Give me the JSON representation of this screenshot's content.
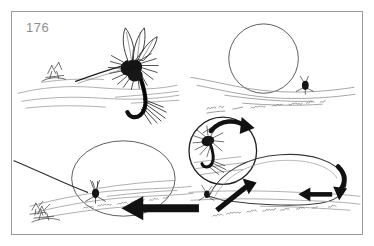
{
  "page": {
    "number_label": "176",
    "background_color": "#ffffff",
    "frame_border_color": "#9a9a9a",
    "ink_color": "#1a1a1a",
    "light_ink_color": "#8d8d8d",
    "page_number_color": "#8d8d8d"
  },
  "figure": {
    "title": "",
    "caption": "",
    "panel_count": 4,
    "panels": [
      {
        "id": "panel-top-left",
        "name": "dry-fly-close-up-panel",
        "description": "Large pen-and-ink drawing of a dry fly with upright divided wings, hackle and tail resting on the water surface",
        "elements": [
          "dry-fly-large",
          "waterline",
          "ripple-lines",
          "small-fly-left"
        ]
      },
      {
        "id": "panel-top-right",
        "name": "magnifier-circle-panel",
        "description": "Open circle outline above a waterline with a small dark fly sitting on the surface and squiggle ripple marks",
        "elements": [
          "magnifier-circle",
          "waterline",
          "small-fly",
          "ripple-squiggles"
        ]
      },
      {
        "id": "panel-bottom-left",
        "name": "magnifier-ellipse-panel",
        "description": "Large ellipse outline over a waterline with a small fly and leader line entering from the left",
        "elements": [
          "magnifier-ellipse",
          "waterline",
          "small-fly",
          "leader-line",
          "ripple-squiggles"
        ]
      },
      {
        "id": "panel-bottom-right",
        "name": "line-loop-arrows-panel",
        "description": "Circle inset showing a fly with a curved rotation arrow, plus a teardrop line loop on the water with bold directional arrows",
        "elements": [
          "inset-circle",
          "fly-in-inset",
          "curved-rotation-arrow",
          "line-loop",
          "arrow-left-large",
          "arrow-diagonal-up-right",
          "arrow-left-small",
          "arrow-curve-down-right",
          "waterline"
        ]
      }
    ]
  },
  "annotations": {
    "arrows": [
      {
        "name": "curved-rotation-arrow",
        "direction": "clockwise-curve",
        "style": "solid-black"
      },
      {
        "name": "arrow-diagonal-up-right",
        "direction": "up-right",
        "style": "solid-black"
      },
      {
        "name": "arrow-left-large",
        "direction": "left",
        "style": "solid-black"
      },
      {
        "name": "arrow-left-small",
        "direction": "left",
        "style": "solid-black"
      },
      {
        "name": "arrow-curve-down-right",
        "direction": "down-curve",
        "style": "solid-black"
      }
    ],
    "magnifiers": [
      {
        "name": "magnifier-circle",
        "shape": "circle"
      },
      {
        "name": "magnifier-ellipse",
        "shape": "ellipse"
      },
      {
        "name": "inset-circle",
        "shape": "circle"
      }
    ]
  }
}
